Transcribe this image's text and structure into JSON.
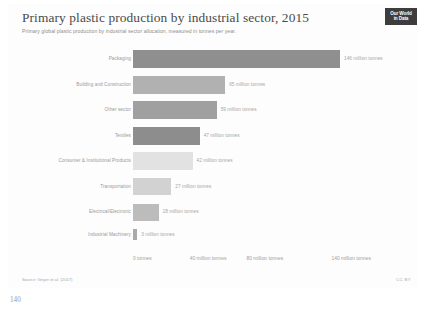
{
  "page": {
    "page_number": "140"
  },
  "header": {
    "title": "Primary plastic production by industrial sector, 2015",
    "subtitle": "Primary global plastic production by industrial sector allocation, measured in tonnes per year.",
    "logo_line1": "Our World",
    "logo_line2": "in Data",
    "logo_name": "our-world-in-data-logo"
  },
  "footer": {
    "source": "Source: Geyer et al. (2017)",
    "license": "CC BY"
  },
  "chart_data": {
    "type": "bar",
    "orientation": "horizontal",
    "title": "Primary plastic production by industrial sector, 2015",
    "subtitle": "Primary global plastic production by industrial sector allocation, measured in tonnes per year.",
    "xlabel": "",
    "ylabel": "",
    "unit": "million tonnes",
    "xlim": [
      0,
      150
    ],
    "grid": false,
    "legend": "none",
    "categories": [
      "Packaging",
      "Building and Construction",
      "Other sector",
      "Textiles",
      "Consumer & Institutional Products",
      "Transportation",
      "Electrical/Electronic",
      "Industrial Machinery"
    ],
    "values": [
      146,
      65,
      59,
      47,
      42,
      27,
      18,
      3
    ],
    "value_labels": [
      "146 million tonnes",
      "65 million tonnes",
      "59 million tonnes",
      "47 million tonnes",
      "42 million tonnes",
      "27 million tonnes",
      "18 million tonnes",
      "3 million tonnes"
    ],
    "bar_colors": [
      "#8f8f8f",
      "#b1b1b1",
      "#a0a0a0",
      "#8d8d8d",
      "#e2e2e2",
      "#d2d2d2",
      "#bcbcbc",
      "#a9a9a9"
    ],
    "xticks": [
      0,
      40,
      80,
      140
    ],
    "xtick_labels": [
      "0 tonnes",
      "40 million tonnes",
      "80 million tonnes",
      "140 million tonnes"
    ]
  }
}
